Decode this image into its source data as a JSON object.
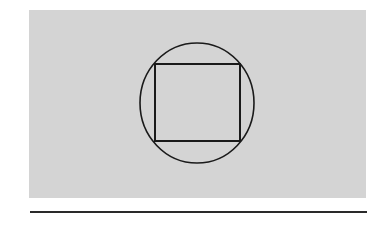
{
  "figure": {
    "background_color": "#ffffff",
    "panel": {
      "x": 29,
      "y": 10,
      "width": 337,
      "height": 188,
      "fill": "#d4d4d4"
    },
    "circle": {
      "cx": 197,
      "cy": 103,
      "rx": 57,
      "ry": 60,
      "stroke": "#1a1a1a",
      "stroke_width": 1.6
    },
    "square": {
      "x": 155,
      "y": 64,
      "width": 85,
      "height": 77,
      "stroke": "#1a1a1a",
      "stroke_width": 2
    },
    "baseline": {
      "x1": 30,
      "y1": 212,
      "x2": 367,
      "y2": 212,
      "stroke": "#2a2a2a",
      "stroke_width": 2
    }
  }
}
